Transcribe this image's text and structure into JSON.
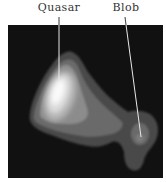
{
  "labels": {
    "quasar": "Quasar",
    "blob": "Blob"
  },
  "colors": {
    "background": "#ffffff",
    "field": "#111111",
    "contour_1": "#4a4a4a",
    "contour_2": "#6a6a6a",
    "contour_3": "#8c8c8c",
    "contour_4": "#b4b4b4",
    "contour_5": "#dcdcdc",
    "core": "#fafafa",
    "pointer_line": "#e8e8e8",
    "label_text": "#333333"
  }
}
